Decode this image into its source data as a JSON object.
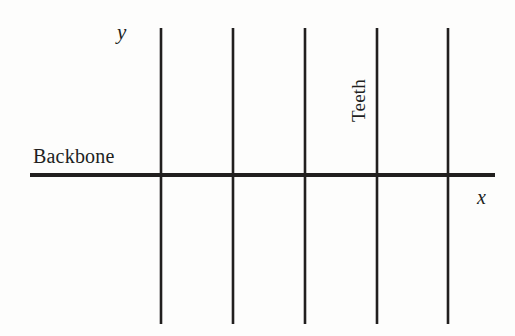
{
  "diagram": {
    "type": "comb-diagram",
    "background_color": "#fdfdfc",
    "stroke_color": "#211f1e",
    "labels": {
      "backbone": "Backbone",
      "teeth": "Teeth",
      "y_axis": "y",
      "x_axis": "x"
    },
    "backbone_line": {
      "name": "backbone",
      "x1": 30,
      "y1": 175,
      "x2": 495,
      "y2": 175,
      "stroke_width": 4
    },
    "teeth_lines": [
      {
        "name": "tooth-1",
        "x": 161,
        "y1": 28,
        "y2": 324,
        "stroke_width": 2.6
      },
      {
        "name": "tooth-2",
        "x": 233,
        "y1": 28,
        "y2": 324,
        "stroke_width": 2.6
      },
      {
        "name": "tooth-3",
        "x": 305,
        "y1": 28,
        "y2": 324,
        "stroke_width": 2.6
      },
      {
        "name": "tooth-4",
        "x": 377,
        "y1": 28,
        "y2": 324,
        "stroke_width": 2.6
      },
      {
        "name": "tooth-5",
        "x": 448,
        "y1": 28,
        "y2": 324,
        "stroke_width": 2.6
      }
    ]
  }
}
